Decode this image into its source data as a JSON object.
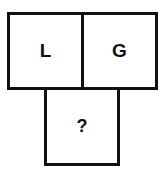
{
  "puzzle": {
    "cells": [
      {
        "position": "top-left",
        "label": "L"
      },
      {
        "position": "top-right",
        "label": "G"
      },
      {
        "position": "bottom",
        "label": "?"
      }
    ]
  },
  "colors": {
    "border": "#111111",
    "text": "#111111",
    "background": "#ffffff"
  }
}
